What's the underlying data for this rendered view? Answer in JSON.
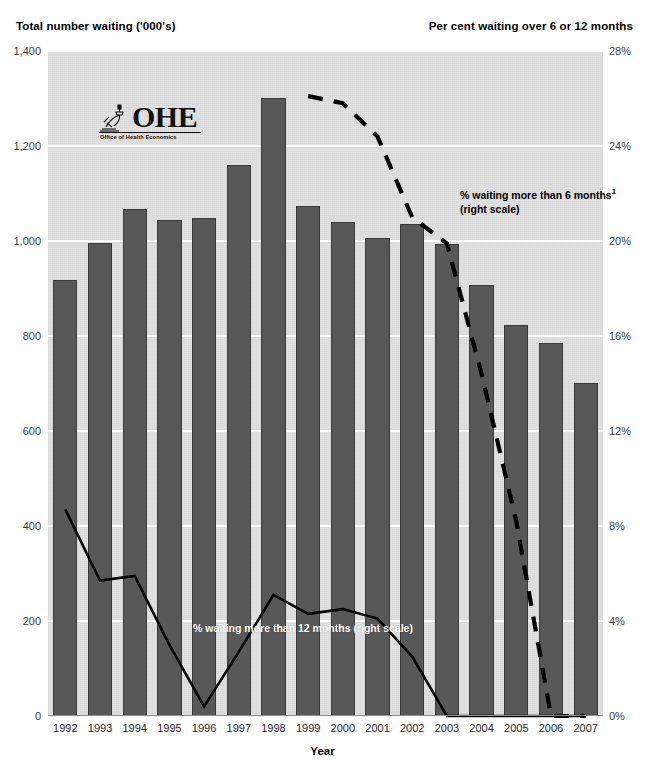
{
  "left_axis_title": "Total number waiting ('000's)",
  "right_axis_title": "Per cent waiting over 6 or 12 months",
  "x_axis_title": "Year",
  "logo": {
    "wordmark": "OHE",
    "subtitle": "Office of Health Economics",
    "icon": "microscope-icon"
  },
  "annotations": {
    "six_month_line1": "% waiting more than 6 months",
    "six_month_footnote": "1",
    "six_month_line2": "(right scale)",
    "twelve_month": "% waiting more than 12 months (right scale)"
  },
  "colors": {
    "bar_fill": "#585858",
    "bar_stroke": "#3a3a3a",
    "plot_background": "#e1e1e1",
    "gridline": "#ffffff",
    "line_12_month": "#000000",
    "line_6_month": "#000000"
  },
  "chart_data": {
    "type": "bar",
    "title": "",
    "subtitle": "",
    "xlabel": "Year",
    "ylabel": "Total number waiting ('000's)",
    "y2label": "Per cent waiting over 6 or 12 months",
    "grid": true,
    "legend_position": "inline-annotation",
    "categories": [
      "1992",
      "1993",
      "1994",
      "1995",
      "1996",
      "1997",
      "1998",
      "1999",
      "2000",
      "2001",
      "2002",
      "2003",
      "2004",
      "2005",
      "2006",
      "2007"
    ],
    "ylim": [
      0,
      1400
    ],
    "y2lim": [
      0,
      28
    ],
    "yticks": [
      "0",
      "200",
      "400",
      "600",
      "800",
      "1,000",
      "1,200",
      "1,400"
    ],
    "ytick_values": [
      0,
      200,
      400,
      600,
      800,
      1000,
      1200,
      1400
    ],
    "y2ticks": [
      "0%",
      "4%",
      "8%",
      "12%",
      "16%",
      "20%",
      "24%",
      "28%"
    ],
    "y2tick_values": [
      0,
      4,
      8,
      12,
      16,
      20,
      24,
      28
    ],
    "series": [
      {
        "name": "Total number waiting ('000's)",
        "type": "bar",
        "axis": "left",
        "values": [
          918,
          995,
          1067,
          1045,
          1048,
          1159,
          1301,
          1074,
          1039,
          1007,
          1035,
          993,
          907,
          824,
          786,
          702
        ]
      },
      {
        "name": "% waiting more than 12 months (right scale)",
        "type": "line",
        "axis": "right",
        "style": "solid",
        "x": [
          "1992",
          "1993",
          "1994",
          "1995",
          "1996",
          "1997",
          "1998",
          "1999",
          "2000",
          "2001",
          "2002",
          "2003",
          "2004",
          "2005",
          "2006",
          "2007"
        ],
        "values": [
          8.7,
          5.7,
          5.9,
          3.0,
          0.4,
          2.7,
          5.1,
          4.3,
          4.5,
          4.1,
          2.5,
          0.0,
          0.0,
          0.0,
          0.0,
          0.0
        ]
      },
      {
        "name": "% waiting more than 6 months (right scale)",
        "type": "line",
        "axis": "right",
        "style": "dashed",
        "x": [
          "1997",
          "1998",
          "1999",
          "2000",
          "2001",
          "2002",
          "2003",
          "2004",
          "2005",
          "2006",
          "2007"
        ],
        "values": [
          null,
          null,
          26.1,
          25.8,
          24.4,
          21.0,
          19.9,
          14.4,
          8.2,
          0.0,
          0.0
        ]
      }
    ]
  }
}
